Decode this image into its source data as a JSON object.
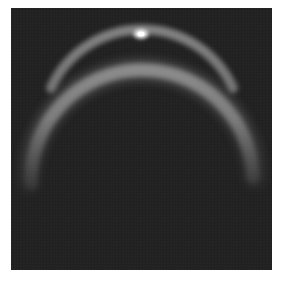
{
  "image": {
    "description": "Grayscale image of a bright glowing crescent arc on a dark background",
    "background_color": "#222222",
    "frame_border_color": "#ffffff",
    "arc": {
      "color": "#d8d8d8",
      "glow_color": "#9a9a9a",
      "center_x": 130,
      "center_y": 128,
      "radius": 103,
      "start_angle_deg": 200,
      "end_angle_deg": 340
    },
    "highlight": {
      "x": 130,
      "y": 26,
      "color": "#ffffff"
    }
  }
}
